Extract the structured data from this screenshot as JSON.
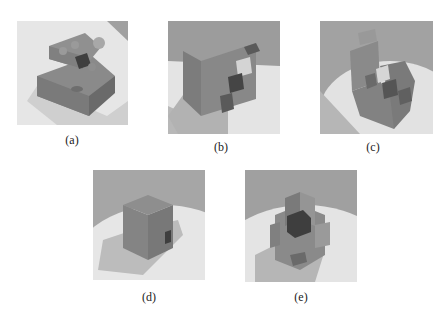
{
  "page": {
    "header_text_cut": true
  },
  "figure": {
    "panels": [
      {
        "id": "a",
        "caption": "(a)",
        "description": "Rendered block puzzle with spherical pegs on stacked slabs"
      },
      {
        "id": "b",
        "caption": "(b)",
        "description": "Rendered L-shaped wall with small cubes attached"
      },
      {
        "id": "c",
        "caption": "(c)",
        "description": "Rendered staircase-like block assembly"
      },
      {
        "id": "d",
        "caption": "(d)",
        "description": "Rendered single cube with shadow"
      },
      {
        "id": "e",
        "caption": "(e)",
        "description": "Rendered interlocking cross-shaped block assembly"
      }
    ]
  },
  "colors": {
    "page_bg": "#ffffff",
    "backdrop_gray": "#9a9a9a",
    "floor_light": "#e8e8e8",
    "shadow": "#b5b5b5",
    "object_mid": "#7e7e7e",
    "object_dark": "#4a4a4a",
    "highlight_cube": "#d8d8d8"
  }
}
